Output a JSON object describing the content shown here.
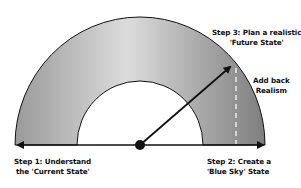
{
  "diagram": {
    "type": "semicircle-arc-process",
    "labels": {
      "step1": {
        "line1": "Step 1: Understand",
        "line2": "the 'Current State'"
      },
      "step2": {
        "line1": "Step 2: Create a",
        "line2": "'Blue Sky' State"
      },
      "step3": {
        "line1": "Step 3: Plan a realistic",
        "line2": "'Future State'"
      },
      "realism": {
        "line1": "Add back",
        "line2": "Realism"
      }
    },
    "colors": {
      "arc_fill_light": "#d8d8d8",
      "arc_fill_dark": "#8a8a8a",
      "stroke": "#111111",
      "dash": "#f2f2f2"
    }
  }
}
